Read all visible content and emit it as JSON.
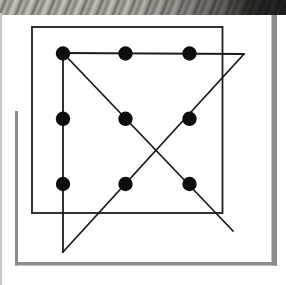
{
  "figure": {
    "canvas": {
      "width": 286,
      "height": 285
    },
    "colors": {
      "background": "#ffffff",
      "ink": "#1c1c1c",
      "dot": "#0d0d0d",
      "frame_gray": "#8b8b8b",
      "frame_gray_dark": "#7f7f7f",
      "page_edge_gray": "#c9c9c9"
    },
    "stroke_width": 1.8,
    "box_outline": {
      "x": 32,
      "y": 27,
      "width": 190.5,
      "height": 186
    },
    "dots": {
      "radius": 7.2,
      "columns_x": [
        63,
        125.5,
        189.5
      ],
      "rows_y": [
        53.5,
        118.8,
        184
      ]
    },
    "solution_lines": [
      {
        "name": "vertical-left-line",
        "x1": 63,
        "y1": 53,
        "x2": 63,
        "y2": 252
      },
      {
        "name": "diagonal-up-right-line",
        "x1": 63,
        "y1": 252,
        "x2": 244,
        "y2": 54
      },
      {
        "name": "horizontal-top-line",
        "x1": 244,
        "y1": 54,
        "x2": 63,
        "y2": 53
      },
      {
        "name": "diagonal-down-right-line",
        "x1": 63,
        "y1": 53,
        "x2": 233,
        "y2": 231
      }
    ],
    "gray_frame": [
      {
        "name": "frame-left-bar",
        "x": 15,
        "y": 111,
        "width": 3,
        "height": 154.5
      },
      {
        "name": "frame-bottom-bar",
        "x": 15,
        "y": 262,
        "width": 262,
        "height": 3.5
      },
      {
        "name": "frame-right-bar",
        "x": 271.5,
        "y": 15,
        "width": 5.5,
        "height": 250.5
      }
    ]
  }
}
